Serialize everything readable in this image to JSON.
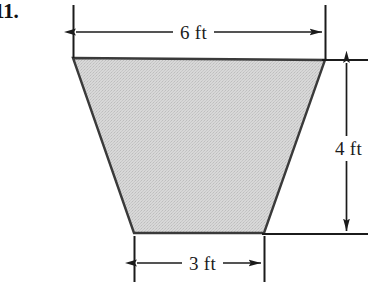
{
  "figure": {
    "problem_number": "11.",
    "shape_name": "trapezoid",
    "fill_color": "#d2d2d2",
    "stroke_color": "#333333",
    "dimensions": {
      "top": "6 ft",
      "right": "4 ft",
      "bottom": "3 ft"
    },
    "units": "ft",
    "measurements": [
      {
        "name": "top-base",
        "label": "6 ft",
        "value": 6,
        "unit": "ft"
      },
      {
        "name": "height",
        "label": "4 ft",
        "value": 4,
        "unit": "ft"
      },
      {
        "name": "bottom-base",
        "label": "3 ft",
        "value": 3,
        "unit": "ft"
      }
    ]
  }
}
